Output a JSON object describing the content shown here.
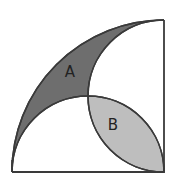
{
  "diagram": {
    "labels": {
      "region_a": "A",
      "region_b": "B"
    },
    "colors": {
      "region_a_fill": "#6e6e6e",
      "region_b_fill": "#bebebe",
      "stroke": "#3a3a3a",
      "background": "#ffffff"
    },
    "shapes": [
      {
        "name": "square",
        "type": "square"
      },
      {
        "name": "quarter-circle",
        "type": "arc",
        "center": "bottom-right corner",
        "radius": "side"
      },
      {
        "name": "bottom-semicircle",
        "type": "semicircle",
        "diameter": "bottom side"
      },
      {
        "name": "right-semicircle",
        "type": "semicircle",
        "diameter": "right side"
      }
    ]
  }
}
